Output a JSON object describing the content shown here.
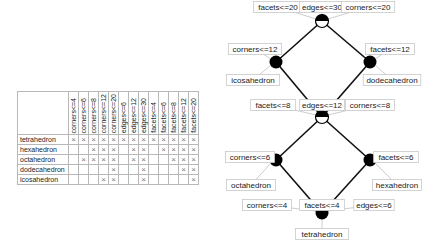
{
  "context_table": {
    "attributes": [
      "corners<=4",
      "corners<=6",
      "corners<=8",
      "corners<=12",
      "corners<=20",
      "edges<=6",
      "edges<=12",
      "edges<=30",
      "facets<=4",
      "facets<=6",
      "facets<=8",
      "facets<=12",
      "facets<=20"
    ],
    "objects": [
      {
        "name": "tetrahedron",
        "crosses": [
          1,
          1,
          1,
          1,
          1,
          1,
          1,
          1,
          1,
          1,
          1,
          1,
          1
        ]
      },
      {
        "name": "hexahedron",
        "crosses": [
          0,
          0,
          1,
          1,
          1,
          0,
          1,
          1,
          0,
          1,
          1,
          1,
          1
        ]
      },
      {
        "name": "octahedron",
        "crosses": [
          0,
          1,
          1,
          1,
          1,
          0,
          1,
          1,
          0,
          0,
          1,
          1,
          1
        ]
      },
      {
        "name": "dodecahedron",
        "crosses": [
          0,
          0,
          0,
          0,
          1,
          0,
          0,
          1,
          0,
          0,
          0,
          1,
          1
        ]
      },
      {
        "name": "icosahedron",
        "crosses": [
          0,
          0,
          0,
          1,
          1,
          0,
          0,
          1,
          0,
          0,
          0,
          0,
          1
        ]
      }
    ],
    "cross_glyph": "×"
  },
  "lattice": {
    "nodes": [
      {
        "id": "top",
        "x": 322,
        "y": 21,
        "style": "half",
        "attr_labels": [
          "facets<=20",
          "edges<=30",
          "corners<=20"
        ],
        "obj_labels": []
      },
      {
        "id": "ico",
        "x": 276,
        "y": 62,
        "style": "full",
        "attr_labels": [
          "corners<=12"
        ],
        "obj_labels": [
          "icosahedron"
        ]
      },
      {
        "id": "dodec",
        "x": 370,
        "y": 62,
        "style": "full",
        "attr_labels": [
          "facets<=12"
        ],
        "obj_labels": [
          "dodecahedron"
        ]
      },
      {
        "id": "mid",
        "x": 322,
        "y": 117,
        "style": "half",
        "attr_labels": [
          "facets<=8",
          "edges<=12",
          "corners<=8"
        ],
        "obj_labels": []
      },
      {
        "id": "octa",
        "x": 276,
        "y": 160,
        "style": "full",
        "attr_labels": [
          "corners<=6"
        ],
        "obj_labels": [
          "octahedron"
        ]
      },
      {
        "id": "hexa",
        "x": 370,
        "y": 160,
        "style": "full",
        "attr_labels": [
          "facets<=6"
        ],
        "obj_labels": [
          "hexahedron"
        ]
      },
      {
        "id": "tetra",
        "x": 322,
        "y": 213,
        "style": "full",
        "attr_labels": [
          "corners<=4",
          "facets<=4",
          "edges<=6"
        ],
        "obj_labels": [
          "tetrahedron"
        ]
      }
    ],
    "edges": [
      [
        "top",
        "ico"
      ],
      [
        "top",
        "dodec"
      ],
      [
        "ico",
        "mid"
      ],
      [
        "dodec",
        "mid"
      ],
      [
        "mid",
        "octa"
      ],
      [
        "mid",
        "hexa"
      ],
      [
        "octa",
        "tetra"
      ],
      [
        "hexa",
        "tetra"
      ]
    ],
    "labels": [
      {
        "text": "facets<=20",
        "x": 278,
        "y": 7,
        "ax": 316,
        "ay": 19
      },
      {
        "text": "edges<=30",
        "x": 322,
        "y": 7,
        "ax": 322,
        "ay": 15
      },
      {
        "text": "corners<=20",
        "x": 368,
        "y": 7,
        "ax": 328,
        "ay": 19
      },
      {
        "text": "corners<=12",
        "x": 255,
        "y": 49,
        "ax": 271,
        "ay": 59
      },
      {
        "text": "icosahedron",
        "x": 253,
        "y": 80,
        "ax": 271,
        "ay": 65
      },
      {
        "text": "facets<=12",
        "x": 390,
        "y": 49,
        "ax": 375,
        "ay": 59
      },
      {
        "text": "dodecahedron",
        "x": 392,
        "y": 80,
        "ax": 375,
        "ay": 65
      },
      {
        "text": "facets<=8",
        "x": 273,
        "y": 105,
        "ax": 316,
        "ay": 115
      },
      {
        "text": "edges<=12",
        "x": 322,
        "y": 105,
        "ax": 322,
        "ay": 111
      },
      {
        "text": "corners<=8",
        "x": 370,
        "y": 105,
        "ax": 328,
        "ay": 115
      },
      {
        "text": "corners<=6",
        "x": 250,
        "y": 157,
        "ax": 270,
        "ay": 160
      },
      {
        "text": "octahedron",
        "x": 251,
        "y": 185,
        "ax": 271,
        "ay": 163
      },
      {
        "text": "facets<=6",
        "x": 396,
        "y": 157,
        "ax": 376,
        "ay": 160
      },
      {
        "text": "hexahedron",
        "x": 397,
        "y": 185,
        "ax": 375,
        "ay": 163
      },
      {
        "text": "corners<=4",
        "x": 267,
        "y": 205,
        "ax": 316,
        "ay": 211
      },
      {
        "text": "facets<=4",
        "x": 322,
        "y": 205,
        "ax": 322,
        "ay": 208
      },
      {
        "text": "edges<=6",
        "x": 374,
        "y": 205,
        "ax": 328,
        "ay": 211
      },
      {
        "text": "tetrahedron",
        "x": 322,
        "y": 234,
        "ax": 322,
        "ay": 219
      }
    ],
    "colors": {
      "node": "#000000",
      "edge": "#111111",
      "label_border": "#c8c8c8",
      "leader": "#c0c0c0"
    }
  }
}
